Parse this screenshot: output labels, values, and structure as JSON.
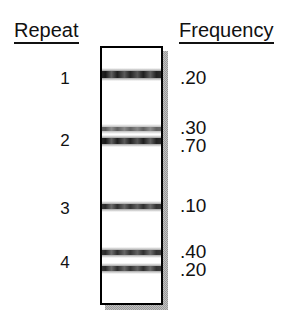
{
  "figure": {
    "width": 300,
    "height": 336,
    "background_color": "#ffffff",
    "ink_color": "#111111",
    "shadow_color": "#9a9a9a"
  },
  "headers": {
    "repeat": "Repeat",
    "frequency": "Frequency"
  },
  "repeats": [
    {
      "label": "1",
      "label_y": 70
    },
    {
      "label": "2",
      "label_y": 132
    },
    {
      "label": "3",
      "label_y": 200
    },
    {
      "label": "4",
      "label_y": 254
    }
  ],
  "gel": {
    "box": {
      "x": 100,
      "y": 46,
      "width": 63,
      "height": 259
    },
    "shadow_offset": 5,
    "border_width": 2,
    "fill_color": "#ffffff",
    "border_color": "#000000"
  },
  "bands": [
    {
      "repeat": "1",
      "frequency": ".20",
      "y": 71,
      "thickness": 7,
      "intensity": "dark"
    },
    {
      "repeat": "2",
      "frequency": ".30",
      "y": 127,
      "thickness": 4,
      "intensity": "light"
    },
    {
      "repeat": "2",
      "frequency": ".70",
      "y": 138,
      "thickness": 6,
      "intensity": "dark"
    },
    {
      "repeat": "3",
      "frequency": ".10",
      "y": 204,
      "thickness": 5,
      "intensity": "medium"
    },
    {
      "repeat": "4",
      "frequency": ".40",
      "y": 250,
      "thickness": 5,
      "intensity": "medium"
    },
    {
      "repeat": "4",
      "frequency": ".20",
      "y": 266,
      "thickness": 5,
      "intensity": "medium"
    }
  ],
  "frequency_labels": [
    {
      "value": ".20",
      "y": 68
    },
    {
      "value": ".30",
      "y": 118
    },
    {
      "value": ".70",
      "y": 136
    },
    {
      "value": ".10",
      "y": 196
    },
    {
      "value": ".40",
      "y": 242
    },
    {
      "value": ".20",
      "y": 260
    }
  ],
  "chart_data": {
    "type": "table",
    "title": "",
    "columns": [
      "Repeat",
      "Frequency"
    ],
    "rows": [
      {
        "Repeat": "1",
        "Frequency": [
          ".20"
        ]
      },
      {
        "Repeat": "2",
        "Frequency": [
          ".30",
          ".70"
        ]
      },
      {
        "Repeat": "3",
        "Frequency": [
          ".10"
        ]
      },
      {
        "Repeat": "4",
        "Frequency": [
          ".40",
          ".20"
        ]
      }
    ],
    "values": [
      0.2,
      0.3,
      0.7,
      0.1,
      0.4,
      0.2
    ],
    "categories": [
      "1",
      "2a",
      "2b",
      "3",
      "4a",
      "4b"
    ],
    "xlabel": "Repeat",
    "ylabel": "Frequency",
    "ylim": [
      0,
      1
    ],
    "grid": false,
    "legend": "none",
    "annotations": [
      "Gel lane diagram: horizontal bands represent alleles within each repeat; adjacent numbers give allele frequency."
    ]
  }
}
